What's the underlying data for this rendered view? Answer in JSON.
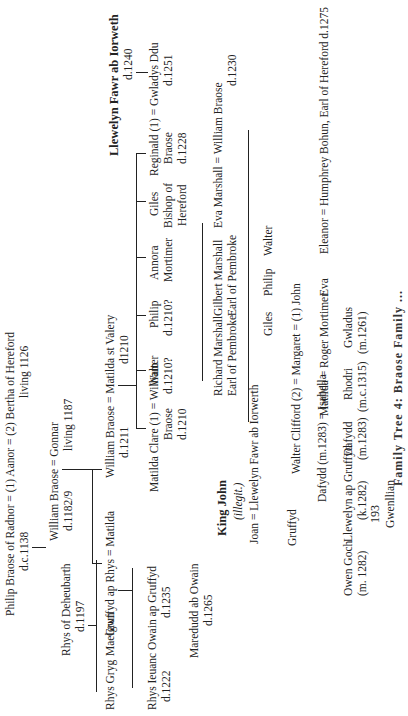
{
  "page_number": "193",
  "caption": "Family Tree 4: Braose Family ...",
  "people": {
    "llewelyn_fawr": {
      "name": "Llewelyn Fawr ab Iorweth",
      "note": "d.1240"
    },
    "reginald": {
      "name": "Reginald (1) = Gwladys Ddu",
      "l2": "Braose",
      "l3": "d.1228",
      "note": "d.1251"
    },
    "giles_bishop": {
      "l1": "Giles",
      "l2": "Bishop of",
      "l3": "Hereford"
    },
    "annora": {
      "l1": "Annora",
      "l2": "Mortimer"
    },
    "philip_1210": {
      "l1": "Philip",
      "l2": "d.1210?"
    },
    "walter_1210": {
      "l1": "Walter",
      "l2": "d.1210?"
    },
    "william_braose_1211": {
      "name": "William Braose  = Matilda st Valery",
      "note1": "d.1211",
      "note2": "d1210"
    },
    "william_braose_1230": {
      "name": "Eva Marshall = William Braose",
      "note": "d.1230"
    },
    "gilbert_marshall": {
      "l1": "Gilbert Marshall",
      "l2": "Earl of Pembroke"
    },
    "richard_marshall": {
      "l1": "Richard Marshall",
      "l2": "Earl of Pembroke"
    },
    "eleanor": {
      "name": "Eleanor = Humphrey Bohun, Earl of Hereford d.1275"
    },
    "eva": {
      "name": "Eva"
    },
    "walter_son": {
      "name": "Walter"
    },
    "philip_son": {
      "name": "Philip"
    },
    "giles_son": {
      "name": "Giles"
    },
    "margaret": {
      "name": "Walter Clifford (2) = Margaret = (1) John"
    },
    "matilda_mortimer": {
      "name": "Matilda = Roger Mortimer"
    },
    "isabella": {
      "name": "Dafydd (m.1283) = Isabella"
    },
    "matilda_clare": {
      "name": "Matilda Clare (1) = William",
      "l2": "Braose",
      "l3": "d.1210"
    },
    "philip_radnor": {
      "name": "Philip Braose of Radnor = (1) Aanor = (2) Bertha of Hereford",
      "note1": "d.c.1138",
      "note2": "living 1126"
    },
    "william_1182": {
      "name": "William Braose = Gonnar",
      "note1": "d.1182/9",
      "note2": "living 1187"
    },
    "gruffyd_rhys": {
      "name": "Gruffyd ap Rhys = Matilda"
    },
    "rhys_deheubarth": {
      "name": "Rhys of Deheubarth",
      "note": "d.1197"
    },
    "rhys_gryg": {
      "name": "Rhys Gryg"
    },
    "maelgwn": {
      "name": "Maelgwn"
    },
    "rhys_ieuanc": {
      "l1": "Rhys Ieuanc",
      "l2": "d.1222"
    },
    "owain_gruffyd": {
      "l1": "Owain ap Gruffyd",
      "l2": "d.1235"
    },
    "maredudd": {
      "l1": "Maredudd ab Owain",
      "l2": "d.1265"
    },
    "king_john": {
      "name": "King John",
      "note": "(illegit.)"
    },
    "joan": {
      "name": "Joan = Llewelyn Fawr ab Iorwerth"
    },
    "gruffyd": {
      "name": "Gruffyd"
    },
    "owen_goch": {
      "l1": "Owen Goch",
      "l2": "(m. 1282)"
    },
    "llewelyn_gruffyd": {
      "l1": "Llewelyn ap Gruffyd",
      "l2": "(k.1282)"
    },
    "gwenllian": {
      "name": "Gwenllian"
    },
    "dafydd": {
      "l1": "Dafydd",
      "l2": "(m.1283)"
    },
    "rhodri": {
      "l1": "Rhodri",
      "l2": "(m.c.1315)"
    },
    "gwladus": {
      "l1": "Gwladus",
      "l2": "(m.1261)"
    }
  }
}
